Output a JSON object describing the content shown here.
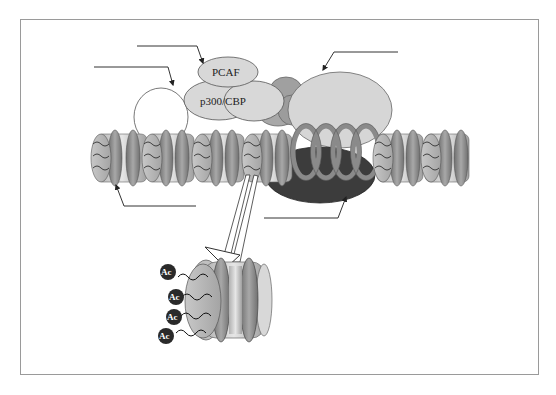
{
  "figure": {
    "type": "schematic",
    "labels": {
      "pcaf": "PCAF",
      "p300_cbp": "p300/CBP",
      "acetyl_mark": "Ac"
    },
    "acetyl_marks_count": 4,
    "callout_lines_without_text": 5,
    "colors": {
      "background": "#ffffff",
      "frame_border": "#9a9a9a",
      "protein_light": "#d8d8d8",
      "protein_mid": "#a8a8a8",
      "nucleosome_core": "#c4c4c4",
      "histone_ring": "#8a8a8a",
      "dark_complex": "#3c3c3c",
      "acetyl_circle": "#2a2a2a",
      "line": "#333333"
    }
  }
}
